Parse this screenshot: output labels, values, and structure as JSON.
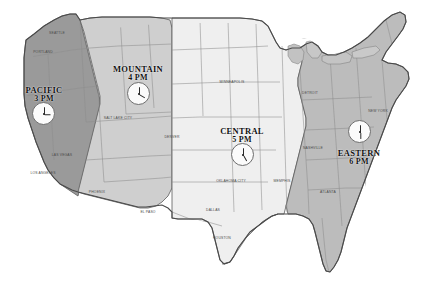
{
  "map": {
    "title": "United States Time Zones",
    "background_color": "#ffffff",
    "border_color": "#5a5a5a",
    "state_border_color": "#8d8d8d"
  },
  "zones": [
    {
      "id": "pacific",
      "name": "PACIFIC",
      "time": "3 PM",
      "hour": 3,
      "minute": 0,
      "fill": "#9a9a9a",
      "label_x": 44,
      "label_y": 86,
      "clock_x": 32,
      "clock_y": 102,
      "clock_size": 23
    },
    {
      "id": "mountain",
      "name": "MOUNTAIN",
      "time": "4 PM",
      "hour": 4,
      "minute": 0,
      "fill": "#cfcfcf",
      "label_x": 138,
      "label_y": 65,
      "clock_x": 127,
      "clock_y": 82,
      "clock_size": 23
    },
    {
      "id": "central",
      "name": "CENTRAL",
      "time": "5 PM",
      "hour": 5,
      "minute": 0,
      "fill": "#efefef",
      "label_x": 242,
      "label_y": 127,
      "clock_x": 231,
      "clock_y": 143,
      "clock_size": 23
    },
    {
      "id": "eastern",
      "name": "EASTERN",
      "time": "6 PM",
      "hour": 6,
      "minute": 0,
      "fill": "#bcbcbc",
      "label_x": 359,
      "label_y": 149,
      "clock_x": 348,
      "clock_y": 120,
      "clock_size": 23
    }
  ],
  "cities": [
    {
      "name": "SEATTLE",
      "x": 57,
      "y": 33
    },
    {
      "name": "PORTLAND",
      "x": 43,
      "y": 52
    },
    {
      "name": "LAS VEGAS",
      "x": 62,
      "y": 155
    },
    {
      "name": "LOS ANGELES",
      "x": 43,
      "y": 173
    },
    {
      "name": "SALT LAKE CITY",
      "x": 118,
      "y": 118
    },
    {
      "name": "DENVER",
      "x": 172,
      "y": 137
    },
    {
      "name": "PHOENIX",
      "x": 97,
      "y": 192
    },
    {
      "name": "EL PASO",
      "x": 148,
      "y": 212
    },
    {
      "name": "MINNEAPOLIS",
      "x": 232,
      "y": 82
    },
    {
      "name": "OKLAHOMA CITY",
      "x": 231,
      "y": 181
    },
    {
      "name": "DALLAS",
      "x": 213,
      "y": 210
    },
    {
      "name": "HOUSTON",
      "x": 222,
      "y": 238
    },
    {
      "name": "MEMPHIS",
      "x": 282,
      "y": 181
    },
    {
      "name": "NASHVILLE",
      "x": 313,
      "y": 148
    },
    {
      "name": "ATLANTA",
      "x": 328,
      "y": 192
    },
    {
      "name": "DETROIT",
      "x": 310,
      "y": 93
    },
    {
      "name": "NEW YORK",
      "x": 378,
      "y": 111
    }
  ]
}
